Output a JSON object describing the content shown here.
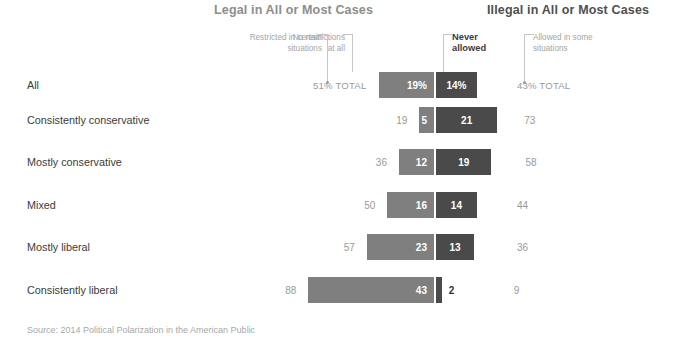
{
  "headers": {
    "left": "Legal in All or Most Cases",
    "right": "Illegal in All or Most Cases"
  },
  "callouts": {
    "restricted": "Restricted in certain\nsituations",
    "no_restrictions": "No restrictions\nat all",
    "never_allowed": "Never\nallowed",
    "allowed_some": "Allowed in some\nsituations"
  },
  "source": "Source: 2014 Political Polarization in the American Public",
  "colors": {
    "light_bar": "#7f7f7f",
    "dark_bar": "#4a4a4a",
    "header_left": "#8d8d8d",
    "header_right": "#4f4f4f",
    "total_text": "#9a9a9a",
    "label_text": "#3b3b3b"
  },
  "chart_data": {
    "type": "bar",
    "title": "",
    "subtype": "diverging-stacked",
    "xlabel": "",
    "ylabel": "",
    "grid": false,
    "legend_position": "top-annotations",
    "series": [
      {
        "name": "Restricted in certain situations",
        "key": "restricted",
        "color": "#ffffff",
        "rendered": false
      },
      {
        "name": "No restrictions at all",
        "key": "no_restrictions",
        "color": "#7f7f7f",
        "rendered": true
      },
      {
        "name": "Never allowed",
        "key": "never_allowed",
        "color": "#4a4a4a",
        "rendered": true
      },
      {
        "name": "Allowed in some situations",
        "key": "allowed_some",
        "color": "#ffffff",
        "rendered": false
      }
    ],
    "categories": [
      "All",
      "Consistently conservative",
      "Mostly conservative",
      "Mixed",
      "Mostly liberal",
      "Consistently liberal"
    ],
    "rows": [
      {
        "label": "All",
        "legal_total": "51% TOTAL",
        "legal_total_value": 51,
        "no_restrictions": "19%",
        "no_restrictions_value": 19,
        "never_allowed": "14%",
        "never_allowed_value": 14,
        "illegal_total": "43% TOTAL",
        "illegal_total_value": 43
      },
      {
        "label": "Consistently conservative",
        "legal_total": "19",
        "legal_total_value": 19,
        "no_restrictions": "5",
        "no_restrictions_value": 5,
        "never_allowed": "21",
        "never_allowed_value": 21,
        "illegal_total": "73",
        "illegal_total_value": 73
      },
      {
        "label": "Mostly conservative",
        "legal_total": "36",
        "legal_total_value": 36,
        "no_restrictions": "12",
        "no_restrictions_value": 12,
        "never_allowed": "19",
        "never_allowed_value": 19,
        "illegal_total": "58",
        "illegal_total_value": 58
      },
      {
        "label": "Mixed",
        "legal_total": "50",
        "legal_total_value": 50,
        "no_restrictions": "16",
        "no_restrictions_value": 16,
        "never_allowed": "14",
        "never_allowed_value": 14,
        "illegal_total": "44",
        "illegal_total_value": 44
      },
      {
        "label": "Mostly liberal",
        "legal_total": "57",
        "legal_total_value": 57,
        "no_restrictions": "23",
        "no_restrictions_value": 23,
        "never_allowed": "13",
        "never_allowed_value": 13,
        "illegal_total": "36",
        "illegal_total_value": 36
      },
      {
        "label": "Consistently liberal",
        "legal_total": "88",
        "legal_total_value": 88,
        "no_restrictions": "43",
        "no_restrictions_value": 43,
        "never_allowed": "2",
        "never_allowed_value": 2,
        "illegal_total": "9",
        "illegal_total_value": 9
      }
    ]
  },
  "layout": {
    "axis_x": 434,
    "px_per_unit": 2.92,
    "row_top": [
      70,
      105,
      147,
      190,
      232,
      275
    ],
    "row_height": 30
  }
}
